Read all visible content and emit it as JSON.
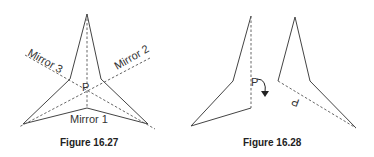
{
  "figures": [
    {
      "caption": "Figure 16.27",
      "labels": {
        "mirror1": "Mirror 1",
        "mirror2": "Mirror 2",
        "mirror3": "Mirror 3",
        "point": "P"
      }
    },
    {
      "caption": "Figure 16.28",
      "labels": {
        "point": "P"
      }
    }
  ]
}
